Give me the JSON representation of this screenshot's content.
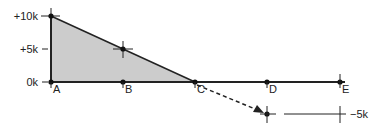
{
  "diagram": {
    "type": "piecewise-linear-value-diagram",
    "y_axis": {
      "ticks": [
        {
          "label": "+10k",
          "value": 10000,
          "y": 16
        },
        {
          "label": "+5k",
          "value": 5000,
          "y": 49
        },
        {
          "label": "0k",
          "value": 0,
          "y": 82
        }
      ],
      "negative_tick": {
        "label": "−5k",
        "value": -5000,
        "y": 114
      }
    },
    "points": [
      {
        "label": "A",
        "x": 51
      },
      {
        "label": "B",
        "x": 123
      },
      {
        "label": "C",
        "x": 195
      },
      {
        "label": "D",
        "x": 267
      },
      {
        "label": "E",
        "x": 340
      }
    ],
    "shaded_region": {
      "from": "A",
      "to": "C",
      "peak_value": "+10k",
      "fill": "#cccccc"
    },
    "slope_line": {
      "from": "+10k at A",
      "to": "0k at C",
      "marked_midpoint": "+5k at B"
    },
    "dashed_arrow": {
      "from": "C (0k)",
      "to": "D (−5k)",
      "style": "dashed"
    },
    "colors": {
      "line": "#222222",
      "fill": "#cccccc",
      "background": "#ffffff"
    }
  }
}
